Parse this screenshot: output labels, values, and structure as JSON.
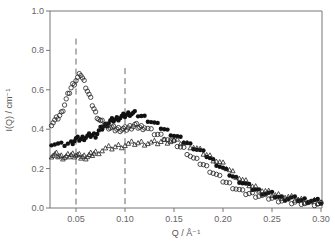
{
  "chart_data": {
    "type": "scatter",
    "title": "",
    "xlabel": "Q / Å⁻¹",
    "ylabel": "I(Q) / cm⁻¹",
    "xlim": [
      0.023,
      0.3
    ],
    "ylim": [
      0.0,
      1.0
    ],
    "x_ticks": [
      0.05,
      0.1,
      0.15,
      0.2,
      0.25,
      0.3
    ],
    "x_tick_labels": [
      "0.05",
      "0.10",
      "0.15",
      "0.20",
      "0.25",
      "0.30"
    ],
    "y_ticks": [
      0.0,
      0.2,
      0.4,
      0.6,
      0.8,
      1.0
    ],
    "y_tick_labels": [
      "0.0",
      "0.2",
      "0.4",
      "0.6",
      "0.8",
      "1.0"
    ],
    "grid": false,
    "legend": null,
    "annotations": [
      {
        "type": "vertical-dashed-line",
        "x": 0.05,
        "y_top": 0.86
      },
      {
        "type": "vertical-dashed-line",
        "x": 0.1,
        "y_top": 0.71
      }
    ],
    "series": [
      {
        "name": "filled circles",
        "marker": "filled-circle",
        "x": [
          0.025,
          0.035,
          0.045,
          0.05,
          0.055,
          0.06,
          0.065,
          0.07,
          0.075,
          0.08,
          0.085,
          0.09,
          0.095,
          0.1,
          0.105,
          0.11,
          0.12,
          0.13,
          0.14,
          0.15,
          0.16,
          0.17,
          0.18,
          0.19,
          0.2,
          0.21,
          0.22,
          0.23,
          0.24,
          0.25,
          0.26,
          0.27,
          0.28,
          0.29,
          0.3
        ],
        "values": [
          0.33,
          0.32,
          0.33,
          0.35,
          0.35,
          0.36,
          0.37,
          0.37,
          0.4,
          0.42,
          0.44,
          0.45,
          0.46,
          0.47,
          0.48,
          0.48,
          0.46,
          0.43,
          0.4,
          0.37,
          0.34,
          0.31,
          0.28,
          0.24,
          0.2,
          0.16,
          0.13,
          0.1,
          0.08,
          0.07,
          0.05,
          0.05,
          0.04,
          0.04,
          0.03
        ]
      },
      {
        "name": "open circles",
        "marker": "open-circle",
        "x": [
          0.025,
          0.03,
          0.035,
          0.04,
          0.045,
          0.05,
          0.055,
          0.06,
          0.065,
          0.07,
          0.075,
          0.08,
          0.085,
          0.09,
          0.095,
          0.1,
          0.105,
          0.11,
          0.115,
          0.12,
          0.13,
          0.14,
          0.15,
          0.16,
          0.17,
          0.18,
          0.19,
          0.2,
          0.21,
          0.22,
          0.23,
          0.24,
          0.25,
          0.26,
          0.27,
          0.28,
          0.29,
          0.3
        ],
        "values": [
          0.43,
          0.45,
          0.48,
          0.55,
          0.61,
          0.65,
          0.68,
          0.62,
          0.55,
          0.48,
          0.44,
          0.42,
          0.41,
          0.4,
          0.4,
          0.4,
          0.41,
          0.42,
          0.41,
          0.41,
          0.38,
          0.36,
          0.33,
          0.3,
          0.25,
          0.22,
          0.18,
          0.14,
          0.11,
          0.08,
          0.07,
          0.06,
          0.05,
          0.04,
          0.03,
          0.03,
          0.02,
          0.02
        ]
      },
      {
        "name": "open triangles",
        "marker": "open-triangle",
        "x": [
          0.025,
          0.03,
          0.035,
          0.04,
          0.045,
          0.05,
          0.055,
          0.06,
          0.065,
          0.07,
          0.08,
          0.09,
          0.1,
          0.11,
          0.12,
          0.13,
          0.14,
          0.15,
          0.16,
          0.17,
          0.18,
          0.19,
          0.2,
          0.21,
          0.22,
          0.23,
          0.24,
          0.25,
          0.26,
          0.27,
          0.28,
          0.29,
          0.3
        ],
        "values": [
          0.27,
          0.27,
          0.26,
          0.26,
          0.27,
          0.27,
          0.26,
          0.26,
          0.27,
          0.28,
          0.3,
          0.31,
          0.32,
          0.33,
          0.33,
          0.33,
          0.34,
          0.34,
          0.33,
          0.31,
          0.28,
          0.25,
          0.22,
          0.18,
          0.14,
          0.11,
          0.09,
          0.07,
          0.06,
          0.05,
          0.04,
          0.03,
          0.03
        ]
      }
    ]
  }
}
